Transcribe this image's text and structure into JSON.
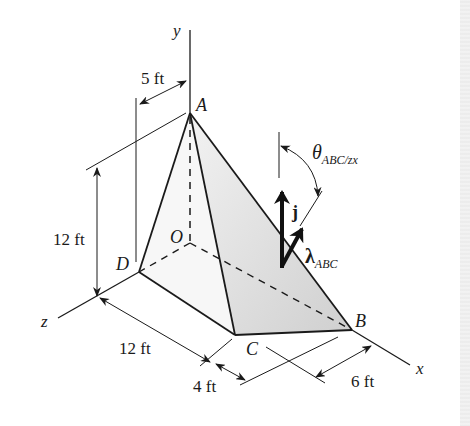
{
  "figure": {
    "type": "3D statics diagram - tetrahedron OABC with unit vector lambda_ABC",
    "axes": {
      "x": "x",
      "y": "y",
      "z": "z"
    },
    "points": {
      "A": "A",
      "B": "B",
      "C": "C",
      "D": "D",
      "O": "O"
    },
    "dimensions": {
      "offset_A": "5 ft",
      "height": "12 ft",
      "z_length": "12 ft",
      "cx_offset": "4 ft",
      "bx_offset": "6 ft"
    },
    "vectors": {
      "j_label": "j",
      "lambda_symbol": "λ",
      "lambda_sub": "ABC"
    },
    "angle": {
      "symbol": "θ",
      "sub": "ABC/zx"
    },
    "colors": {
      "ink": "#1a1a1a",
      "shade_face": "#d9d9d9",
      "shade_face_light": "#ededed",
      "background": "#ffffff"
    }
  }
}
